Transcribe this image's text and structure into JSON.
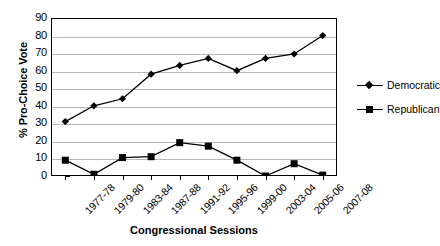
{
  "chart_data": {
    "type": "line",
    "title": "",
    "xlabel": "Congressional Sessions",
    "ylabel": "% Pro-Choice Vote",
    "ylim": [
      0,
      90
    ],
    "ytick_step": 10,
    "yticks": [
      90,
      80,
      70,
      60,
      50,
      40,
      30,
      20,
      10,
      0
    ],
    "grid": true,
    "legend_position": "right",
    "categories": [
      "1977-78",
      "1979-80",
      "1983-84",
      "1987-88",
      "1991-92",
      "1995-96",
      "1999-00",
      "2003-04",
      "2005-06",
      "2007-08"
    ],
    "series": [
      {
        "name": "Democratic",
        "marker": "diamond",
        "color": "#000000",
        "values": [
          31,
          40,
          44,
          58,
          63,
          67,
          60,
          67,
          69.5,
          80
        ]
      },
      {
        "name": "Republican",
        "marker": "square",
        "color": "#000000",
        "values": [
          9,
          1,
          10.5,
          11,
          19,
          17,
          9,
          0,
          7,
          0.5
        ]
      }
    ]
  },
  "legend": {
    "items": [
      {
        "label": "Democratic",
        "marker": "diamond"
      },
      {
        "label": "Republican",
        "marker": "square"
      }
    ]
  }
}
